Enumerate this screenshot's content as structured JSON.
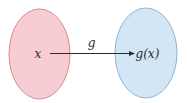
{
  "diagram": {
    "type": "function-mapping",
    "domain_set": {
      "element_label": "x",
      "fill": "#f7cdd3",
      "stroke": "#d98a95"
    },
    "codomain_set": {
      "element_label": "g(x)",
      "fill": "#d3e6f6",
      "stroke": "#8fb4d8"
    },
    "mapping_arrow": {
      "label": "g",
      "color": "#2b2b2b"
    }
  }
}
